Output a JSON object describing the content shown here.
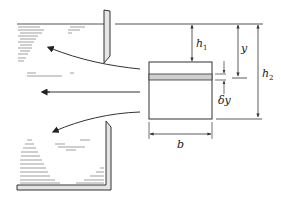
{
  "diagram": {
    "type": "flow through rectangular orifice / sluice diagram",
    "labels": {
      "h1": {
        "main": "h",
        "sub": "1"
      },
      "h2": {
        "main": "h",
        "sub": "2"
      },
      "y": "y",
      "delta_y": "δy",
      "b": "b"
    },
    "elements": [
      "free-surface-line",
      "vertical-gate-plate",
      "rectangular-orifice",
      "shaded-elemental-strip",
      "streamline-upper",
      "streamline-middle",
      "streamline-lower",
      "tank-bottom-wall",
      "tank-right-wall",
      "water-hatching"
    ],
    "colors": {
      "line": "#333333",
      "strip_fill": "#cfcfcf",
      "wall_fill": "#e4e4e4",
      "hatch": "#666666"
    }
  }
}
